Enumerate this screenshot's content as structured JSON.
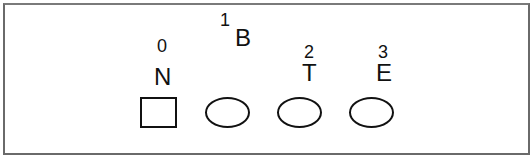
{
  "diagram": {
    "nodes": [
      {
        "index": "0",
        "letter": "N",
        "shape": "square"
      },
      {
        "index": "1",
        "letter": "B",
        "shape": "ellipse"
      },
      {
        "index": "2",
        "letter": "T",
        "shape": "ellipse"
      },
      {
        "index": "3",
        "letter": "E",
        "shape": "ellipse"
      }
    ]
  }
}
